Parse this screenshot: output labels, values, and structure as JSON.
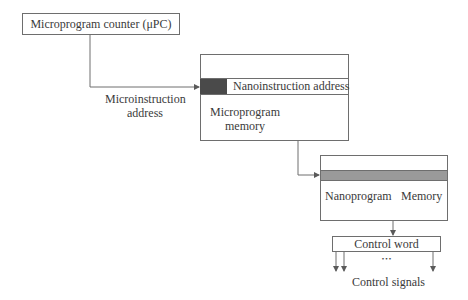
{
  "diagram": {
    "counter_box": {
      "label": "Microprogram counter (μPC)"
    },
    "micro_address_label": {
      "line1": "Microinstruction",
      "line2": "address"
    },
    "microprogram_memory": {
      "field_label": "Nanoinstruction address",
      "label_line1": "Microprogram",
      "label_line2": "memory"
    },
    "nanoprogram_memory": {
      "left_label": "Nanoprogram",
      "right_label": "Memory"
    },
    "control_word": {
      "label": "Control word",
      "ellipsis": "•••"
    },
    "control_signals": {
      "label": "Control signals"
    },
    "colors": {
      "line": "#6e6e6e",
      "dark_field": "#4a4a4a",
      "gray_band": "#9a9a9a"
    }
  }
}
